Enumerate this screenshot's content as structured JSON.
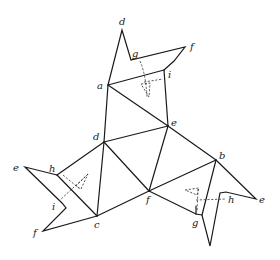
{
  "diagram": {
    "type": "polyhedron net with folding flaps",
    "labels": {
      "top_d": "d",
      "top_g": "g",
      "top_f": "f",
      "top_i": "i",
      "a": "a",
      "center_e": "e",
      "center_d": "d",
      "b": "b",
      "left_e": "e",
      "left_h": "h",
      "left_i": "i",
      "left_f": "f",
      "c": "c",
      "center_f": "f",
      "right_g": "g",
      "right_h": "h",
      "right_e": "e"
    },
    "colors": {
      "line": "#1a1a1a",
      "background": "#ffffff"
    }
  }
}
